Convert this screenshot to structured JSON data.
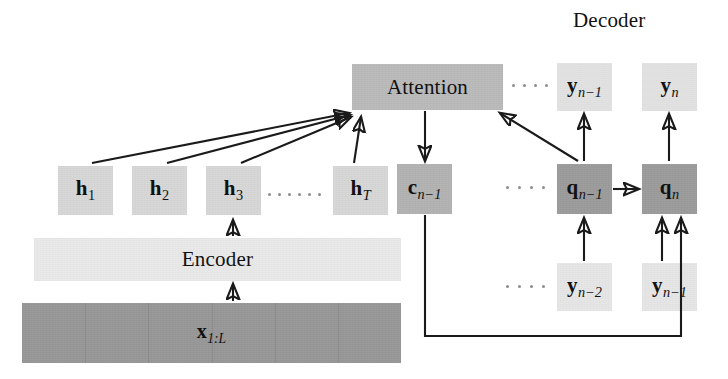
{
  "figure": {
    "type": "neural-network-architecture-diagram",
    "section_titles": [
      {
        "name": "decoder",
        "text": "Decoder",
        "x": 573,
        "y": 10
      }
    ]
  },
  "colors": {
    "hidden_state": "#d8d8d8",
    "context": "#b4b4b4",
    "attention": "#bcbcbc",
    "decoder_state": "#9e9e9e",
    "output": "#e2e2e2",
    "input_token": "#e6e6e6",
    "encoder_bar": "#e9e9e9",
    "source_bar": "#9a9a9a",
    "stroke": "#1a1a1a",
    "background": "#ffffff"
  },
  "encoder": {
    "bar_label": "Encoder",
    "source_label_base": "x",
    "source_label_sub": "1:L",
    "hidden_states": [
      {
        "name": "h1",
        "base": "h",
        "sub": "1",
        "x": 58,
        "y": 166,
        "w": 55,
        "h": 49
      },
      {
        "name": "h2",
        "base": "h",
        "sub": "2",
        "x": 132,
        "y": 166,
        "w": 55,
        "h": 49
      },
      {
        "name": "h3",
        "base": "h",
        "sub": "3",
        "x": 206,
        "y": 166,
        "w": 55,
        "h": 49
      },
      {
        "name": "hT",
        "base": "h",
        "sub": "T",
        "x": 333,
        "y": 166,
        "w": 55,
        "h": 49
      }
    ]
  },
  "attention": {
    "label": "Attention",
    "x": 352,
    "y": 64,
    "w": 151,
    "h": 46
  },
  "context": {
    "name": "c_n-1",
    "base": "c",
    "sub": "n−1",
    "x": 397,
    "y": 164,
    "w": 55,
    "h": 50
  },
  "decoder": {
    "states": [
      {
        "name": "q_n-1",
        "base": "q",
        "sub": "n−1",
        "x": 557,
        "y": 164,
        "w": 55,
        "h": 50
      },
      {
        "name": "q_n",
        "base": "q",
        "sub": "n",
        "x": 642,
        "y": 164,
        "w": 55,
        "h": 50
      }
    ],
    "outputs": [
      {
        "name": "y_n-1",
        "base": "y",
        "sub": "n−1",
        "x": 557,
        "y": 63,
        "w": 55,
        "h": 48
      },
      {
        "name": "y_n",
        "base": "y",
        "sub": "n",
        "x": 642,
        "y": 63,
        "w": 55,
        "h": 48
      }
    ],
    "inputs": [
      {
        "name": "y_n-2",
        "base": "y",
        "sub": "n−2",
        "x": 557,
        "y": 263,
        "w": 55,
        "h": 48
      },
      {
        "name": "y_n-1_in",
        "base": "y",
        "sub": "n−1",
        "x": 642,
        "y": 263,
        "w": 55,
        "h": 48
      }
    ]
  },
  "ellipses": [
    {
      "name": "ellipsis-hidden-states",
      "count": 6,
      "x": 268,
      "y": 194,
      "dot": 3,
      "gap": 7
    },
    {
      "name": "ellipsis-attention-row",
      "count": 4,
      "x": 513,
      "y": 85,
      "dot": 3,
      "gap": 8
    },
    {
      "name": "ellipsis-output-row",
      "count": 4,
      "x": 513,
      "y": 85,
      "dot": 3,
      "gap": 8
    },
    {
      "name": "ellipsis-state-row",
      "count": 4,
      "x": 508,
      "y": 187,
      "dot": 3,
      "gap": 9
    },
    {
      "name": "ellipsis-input-row",
      "count": 4,
      "x": 508,
      "y": 286,
      "dot": 3,
      "gap": 9
    }
  ],
  "bars": {
    "encoder": {
      "x": 34,
      "y": 238,
      "w": 367,
      "h": 43
    },
    "source": {
      "x": 22,
      "y": 303,
      "w": 379,
      "h": 60
    }
  }
}
